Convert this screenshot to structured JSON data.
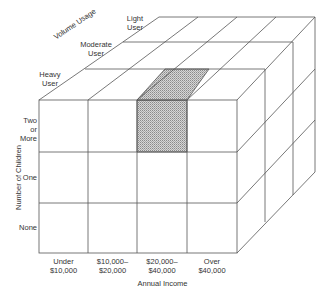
{
  "diagram": {
    "type": "3d-segmentation-cube",
    "axes": {
      "x": {
        "title": "Annual Income",
        "categories": [
          {
            "line1": "Under",
            "line2": "$10,000"
          },
          {
            "line1": "$10,000–",
            "line2": "$20,000"
          },
          {
            "line1": "$20,000–",
            "line2": "$40,000"
          },
          {
            "line1": "Over",
            "line2": "$40,000"
          }
        ]
      },
      "y": {
        "title": "Number of Children",
        "categories": [
          {
            "lines": [
              "Two",
              "or",
              "More"
            ]
          },
          {
            "lines": [
              "One"
            ]
          },
          {
            "lines": [
              "None"
            ]
          }
        ]
      },
      "z": {
        "title": "Volume Usage",
        "categories": [
          {
            "line1": "Heavy",
            "line2": "User"
          },
          {
            "line1": "Moderate",
            "line2": "User"
          },
          {
            "line1": "Light",
            "line2": "User"
          }
        ]
      }
    },
    "highlighted_cell": {
      "income": "$20,000–$40,000",
      "children": "Two or More",
      "usage": "Heavy User",
      "fill": "#bdbdbd"
    },
    "line_color": "#555555"
  }
}
